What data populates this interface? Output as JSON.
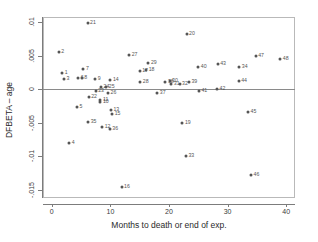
{
  "chart_data": {
    "type": "scatter",
    "title": "",
    "xlabel": "Months to death or end of exp.",
    "ylabel": "DFBETA – age",
    "xlim": [
      -1.5,
      41.5
    ],
    "ylim": [
      -0.0162,
      0.0108
    ],
    "xticks": [
      0,
      10,
      20,
      30,
      40
    ],
    "xticklabels": [
      "0",
      "10",
      "20",
      "30",
      "40"
    ],
    "yticks": [
      0.01,
      0.005,
      0,
      -0.005,
      -0.01,
      -0.015
    ],
    "yticklabels": [
      ".01",
      ".005",
      "0",
      "-.005",
      "-.01",
      "-.015"
    ],
    "grid": false,
    "legend": null,
    "reference_line": {
      "y": 0,
      "color": "#8a8a8a"
    },
    "marker_color": "#555555",
    "point_label_position": "right",
    "points": [
      {
        "label": "1",
        "x": 1.8,
        "y": 0.0024
      },
      {
        "label": "2",
        "x": 1.2,
        "y": 0.00565
      },
      {
        "label": "3",
        "x": 2.1,
        "y": 0.00148
      },
      {
        "label": "4",
        "x": 3.0,
        "y": -0.008
      },
      {
        "label": "5",
        "x": 4.3,
        "y": -0.00265
      },
      {
        "label": "6",
        "x": 4.5,
        "y": 0.0017
      },
      {
        "label": "7",
        "x": 5.4,
        "y": 0.003
      },
      {
        "label": "8",
        "x": 5.1,
        "y": 0.0017
      },
      {
        "label": "9",
        "x": 7.4,
        "y": 0.0016
      },
      {
        "label": "10",
        "x": 8.3,
        "y": -0.0019
      },
      {
        "label": "11",
        "x": 8.3,
        "y": -0.00155
      },
      {
        "label": "12",
        "x": 8.6,
        "y": -0.0056
      },
      {
        "label": "13",
        "x": 10.1,
        "y": -0.0031
      },
      {
        "label": "14",
        "x": 10.0,
        "y": 0.00145
      },
      {
        "label": "15",
        "x": 10.3,
        "y": -0.0036
      },
      {
        "label": "16",
        "x": 11.9,
        "y": -0.0145
      },
      {
        "label": "17",
        "x": 15.0,
        "y": 0.00275
      },
      {
        "label": "18",
        "x": 16.1,
        "y": 0.00285
      },
      {
        "label": "19",
        "x": 22.3,
        "y": -0.005
      },
      {
        "label": "20",
        "x": 23.0,
        "y": 0.0082
      },
      {
        "label": "21",
        "x": 6.1,
        "y": 0.00995
      },
      {
        "label": "22",
        "x": 6.3,
        "y": -0.0011
      },
      {
        "label": "23",
        "x": 7.5,
        "y": -0.0002
      },
      {
        "label": "24",
        "x": 8.4,
        "y": 0.0004
      },
      {
        "label": "25",
        "x": 9.3,
        "y": 0.00035
      },
      {
        "label": "26",
        "x": 9.6,
        "y": -0.00055
      },
      {
        "label": "27",
        "x": 13.2,
        "y": 0.0051
      },
      {
        "label": "28",
        "x": 15.1,
        "y": 0.0011
      },
      {
        "label": "29",
        "x": 16.5,
        "y": 0.004
      },
      {
        "label": "30",
        "x": 20.1,
        "y": 0.0012
      },
      {
        "label": "31",
        "x": 20.4,
        "y": 0.00085
      },
      {
        "label": "32",
        "x": 21.8,
        "y": 0.0008
      },
      {
        "label": "33",
        "x": 22.9,
        "y": -0.00995
      },
      {
        "label": "34",
        "x": 32.0,
        "y": 0.0034
      },
      {
        "label": "35",
        "x": 6.2,
        "y": -0.0048
      },
      {
        "label": "36",
        "x": 9.9,
        "y": -0.0059
      },
      {
        "label": "37",
        "x": 18.0,
        "y": -0.0006
      },
      {
        "label": "38",
        "x": 19.4,
        "y": 0.0011
      },
      {
        "label": "39",
        "x": 23.4,
        "y": 0.00115
      },
      {
        "label": "40",
        "x": 25.0,
        "y": 0.0033
      },
      {
        "label": "41",
        "x": 25.1,
        "y": -0.00025
      },
      {
        "label": "42",
        "x": 28.2,
        "y": 0.0001
      },
      {
        "label": "43",
        "x": 28.3,
        "y": 0.00375
      },
      {
        "label": "44",
        "x": 31.9,
        "y": 0.0012
      },
      {
        "label": "45",
        "x": 33.5,
        "y": -0.0034
      },
      {
        "label": "46",
        "x": 34.0,
        "y": -0.0127
      },
      {
        "label": "47",
        "x": 34.8,
        "y": 0.005
      },
      {
        "label": "48",
        "x": 39.0,
        "y": 0.0046
      }
    ]
  }
}
